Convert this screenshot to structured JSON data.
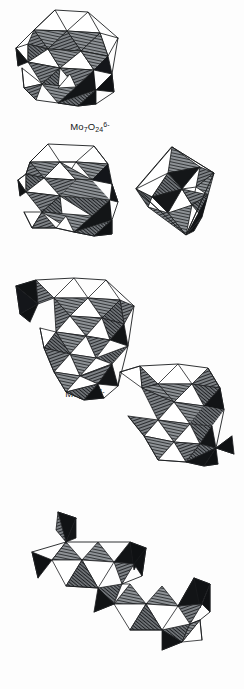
{
  "figure": {
    "kind": "scanned-line-drawing-plate",
    "background_color": "#fdfdfd",
    "ink_color": "#1a1c1e",
    "hatch_color": "#3a3d40",
    "face_light_color": "#ffffff",
    "face_dark_color": "#111315"
  },
  "structures": [
    {
      "id": "mo7o24",
      "name": "heptamolybdate",
      "caption_plain": "Mo7O24 6-",
      "element": "Mo",
      "metal_count": "7",
      "oxygen_count": "24",
      "charge": "6-",
      "bracketed": false,
      "polymeric": false,
      "octahedra_count": 7
    },
    {
      "id": "mo8o26",
      "name": "octamolybdate",
      "caption_plain": "Mo8O26 4-",
      "element": "Mo",
      "metal_count": "8",
      "oxygen_count": "26",
      "charge": "4-",
      "bracketed": false,
      "polymeric": false,
      "octahedra_count": 8
    },
    {
      "id": "mo6o19",
      "name": "hexamolybdate (Lindqvist)",
      "caption_plain": "Mo6O19 2-",
      "element": "Mo",
      "metal_count": "6",
      "oxygen_count": "19",
      "charge": "2-",
      "bracketed": false,
      "polymeric": false,
      "octahedra_count": 6
    },
    {
      "id": "mo8o27",
      "name": "polymeric octamolybdate chain",
      "caption_plain": "[Mo8O27 6-]n",
      "element": "Mo",
      "metal_count": "8",
      "oxygen_count": "27",
      "charge": "6-",
      "bracketed": true,
      "polymeric": true,
      "repeat_subscript": "n",
      "octahedra_count": 16
    },
    {
      "id": "mo4o14",
      "name": "polymeric tetramolybdate chain",
      "caption_plain": "[Mo4O14 4-]n",
      "element": "Mo",
      "metal_count": "4",
      "oxygen_count": "14",
      "charge": "4-",
      "bracketed": true,
      "polymeric": true,
      "repeat_subscript": "n",
      "octahedra_count": 8
    }
  ],
  "captions": {
    "mo7o24": {
      "element": "Mo",
      "n_metal": "7",
      "o": "O",
      "n_oxy": "24",
      "charge": "6-"
    },
    "mo8o26": {
      "element": "Mo",
      "n_metal": "8",
      "o": "O",
      "n_oxy": "26",
      "charge": "4-"
    },
    "mo6o19": {
      "element": "Mo",
      "n_metal": "6",
      "o": "O",
      "n_oxy": "19",
      "charge": "2-"
    },
    "mo8o27": {
      "open": "[",
      "element": "Mo",
      "n_metal": "8",
      "o": "O",
      "n_oxy": "27",
      "charge": "6-",
      "close": "]",
      "repeat": "n"
    },
    "mo4o14": {
      "open": "[",
      "element": "Mo",
      "n_metal": "4",
      "o": "O",
      "n_oxy": "14",
      "charge": "4-",
      "close": "]",
      "repeat": "n"
    }
  }
}
